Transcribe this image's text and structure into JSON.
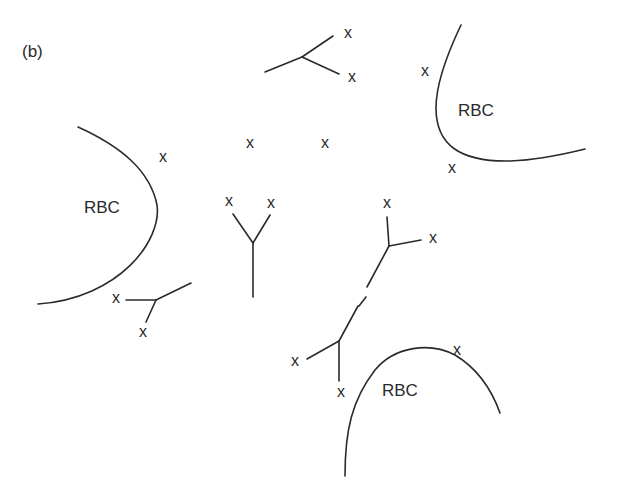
{
  "figure": {
    "panel_label": "(b)",
    "cell_label": "RBC",
    "marker_label": "x"
  },
  "cells": [
    {
      "label": "RBC",
      "label_pos": [
        84,
        213
      ],
      "path": "M78,127 C120,146 150,170 157,205 C162,240 120,298 38,304"
    },
    {
      "label": "RBC",
      "label_pos": [
        458,
        116
      ],
      "path": "M461,25 C450,48 436,80 436,108 C436,145 460,162 510,161 C540,160 565,154 585,149"
    },
    {
      "label": "RBC",
      "label_pos": [
        382,
        396
      ],
      "path": "M345,476 C345,430 352,400 375,370 C395,346 430,342 455,355 C475,367 490,385 500,413"
    }
  ],
  "markers": [
    {
      "pos": [
        348,
        38
      ]
    },
    {
      "pos": [
        352,
        82
      ]
    },
    {
      "pos": [
        425,
        76
      ]
    },
    {
      "pos": [
        452,
        173
      ]
    },
    {
      "pos": [
        163,
        162
      ]
    },
    {
      "pos": [
        250,
        148
      ]
    },
    {
      "pos": [
        325,
        148
      ]
    },
    {
      "pos": [
        229,
        206
      ]
    },
    {
      "pos": [
        271,
        208
      ]
    },
    {
      "pos": [
        387,
        208
      ]
    },
    {
      "pos": [
        433,
        243
      ]
    },
    {
      "pos": [
        116,
        303
      ]
    },
    {
      "pos": [
        143,
        337
      ]
    },
    {
      "pos": [
        295,
        366
      ]
    },
    {
      "pos": [
        341,
        397
      ]
    },
    {
      "pos": [
        457,
        355
      ]
    }
  ],
  "branches": [
    {
      "name": "top-branch",
      "segments": [
        "M265,72 L302,57",
        "M302,57 L333,36",
        "M302,57 L339,74"
      ]
    },
    {
      "name": "y-branch",
      "segments": [
        "M233,214 L253,243",
        "M270,215 L253,243",
        "M253,243 L253,297"
      ]
    },
    {
      "name": "right-branch",
      "segments": [
        "M387,217 L389,246",
        "M389,246 L421,240",
        "M389,246 L367,287"
      ]
    },
    {
      "name": "connector-lower",
      "segments": [
        "M366,297 L359,306"
      ]
    },
    {
      "name": "lower-branch",
      "segments": [
        "M358,306 L339,341",
        "M339,341 L307,359",
        "M339,341 L339,381"
      ]
    },
    {
      "name": "bottom-left-branch",
      "segments": [
        "M126,300 L156,300",
        "M156,300 L191,283",
        "M156,300 L146,322"
      ]
    }
  ]
}
